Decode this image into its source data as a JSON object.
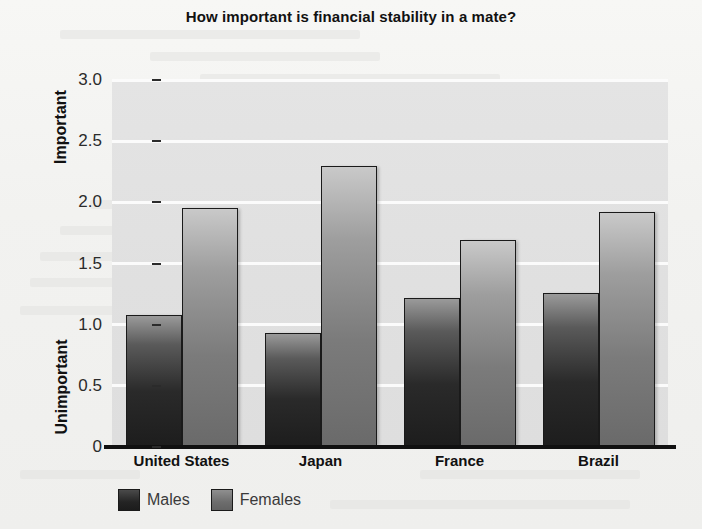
{
  "chart_data": {
    "type": "bar",
    "title": "How important is financial stability in a mate?",
    "xlabel": "",
    "ylabel": "",
    "categories": [
      "United States",
      "Japan",
      "France",
      "Brazil"
    ],
    "series": [
      {
        "name": "Males",
        "color": "#242424",
        "values": [
          1.08,
          0.93,
          1.22,
          1.26
        ]
      },
      {
        "name": "Females",
        "color": "#6d6d6d",
        "values": [
          1.95,
          2.3,
          1.69,
          1.92
        ]
      }
    ],
    "ylim": [
      0,
      3.0
    ],
    "yticks": [
      0,
      0.5,
      1.0,
      1.5,
      2.0,
      2.5,
      3.0
    ],
    "ytick_labels": [
      "0",
      "0.5",
      "1.0",
      "1.5",
      "2.0",
      "2.5",
      "3.0"
    ],
    "y_axis_low_label": "Unimportant",
    "y_axis_high_label": "Important",
    "grid": true,
    "legend_position": "bottom-left"
  },
  "legend": {
    "items": [
      {
        "label": "Males"
      },
      {
        "label": "Females"
      }
    ]
  }
}
